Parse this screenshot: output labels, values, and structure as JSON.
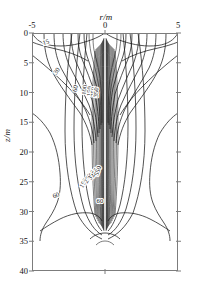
{
  "chart_data": {
    "type": "line",
    "title": "",
    "xlabel": "r/m",
    "ylabel": "z/m",
    "xlim": [
      -5,
      5
    ],
    "ylim": [
      0,
      40
    ],
    "y_inverted": true,
    "grid": false,
    "legend": null,
    "x_axis_position": "top",
    "xticks": [
      -5,
      0,
      5
    ],
    "xticklabels": [
      "-5",
      "0",
      "5"
    ],
    "yticks": [
      0,
      5,
      10,
      15,
      20,
      25,
      30,
      35,
      40
    ],
    "yticklabels": [
      "0",
      "5",
      "10",
      "15",
      "20",
      "25",
      "30",
      "35",
      "40"
    ],
    "contour_labels": [
      {
        "text": "15",
        "r": -4.0,
        "z": 1.9,
        "rotation": -18
      },
      {
        "text": "30",
        "r": -3.2,
        "z": 6.6,
        "rotation": -52
      },
      {
        "text": "60",
        "r": -1.9,
        "z": 9.4,
        "rotation": -76
      },
      {
        "text": "100",
        "r": -1.25,
        "z": 9.6,
        "rotation": -84
      },
      {
        "text": "150",
        "r": -0.92,
        "z": 9.8,
        "rotation": -86
      },
      {
        "text": "250",
        "r": -0.66,
        "z": 9.9,
        "rotation": -88
      },
      {
        "text": "350",
        "r": -0.46,
        "z": 10.0,
        "rotation": -88
      },
      {
        "text": "60",
        "r": -3.3,
        "z": 27.6,
        "rotation": -22
      },
      {
        "text": "60",
        "r": -0.35,
        "z": 28.6,
        "rotation": 0
      },
      {
        "text": "150",
        "r": -1.35,
        "z": 25.4,
        "rotation": -60
      },
      {
        "text": "250",
        "r": -1.05,
        "z": 24.6,
        "rotation": -62
      },
      {
        "text": "350",
        "r": -0.8,
        "z": 24.0,
        "rotation": -64
      },
      {
        "text": "450",
        "r": -0.58,
        "z": 23.6,
        "rotation": -66
      },
      {
        "text": "550",
        "r": -0.36,
        "z": 23.3,
        "rotation": -68
      }
    ],
    "levels": [
      15,
      30,
      60,
      100,
      150,
      250,
      350,
      450,
      550
    ],
    "colors": {
      "line": "#1a1a1a",
      "frame": "#7c7c7c",
      "background": "#ffffff"
    }
  }
}
